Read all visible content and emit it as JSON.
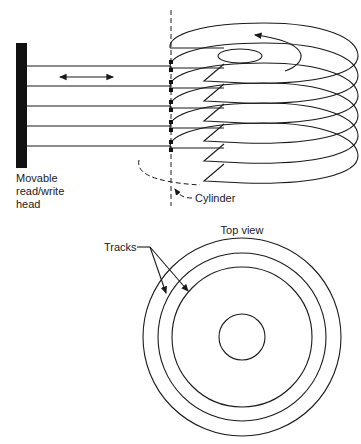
{
  "side_view": {
    "head_label_lines": [
      "Movable",
      "read/write",
      "head"
    ],
    "cylinder_label": "Cylinder",
    "platter_count": 6,
    "arm_count": 5
  },
  "top_view": {
    "title": "Top view",
    "tracks_label": "Tracks",
    "track_circle_count": 3
  },
  "colors": {
    "line": "#1a1a1a",
    "background": "#ffffff"
  }
}
